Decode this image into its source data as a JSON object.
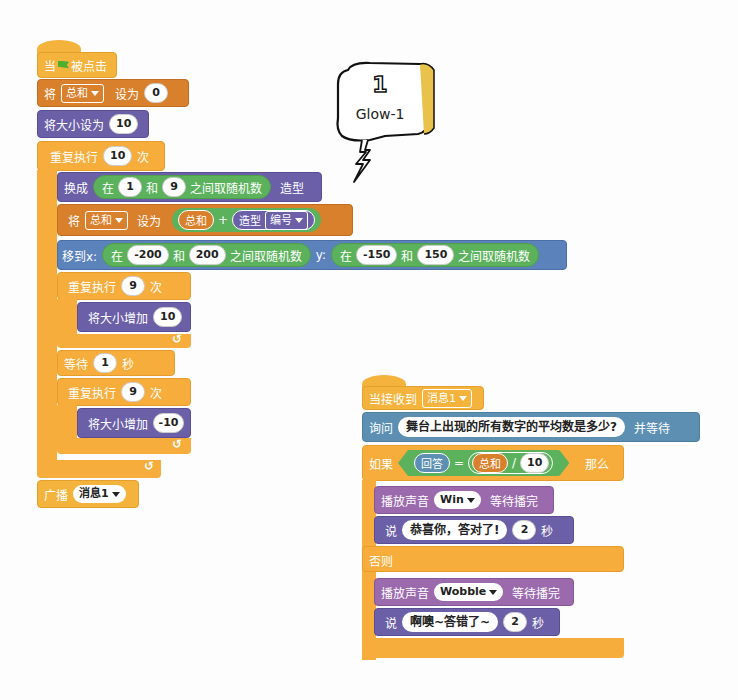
{
  "script1": {
    "hat": {
      "when": "当",
      "flag_icon": "green-flag-icon",
      "clicked": "被点击"
    },
    "set_var": {
      "label": "将",
      "var": "总和",
      "to": "设为",
      "value": "0"
    },
    "set_size": {
      "label": "将大小设为",
      "value": "10"
    },
    "repeat_outer": {
      "label": "重复执行",
      "count": "10",
      "times": "次"
    },
    "switch_costume": {
      "label": "换成",
      "rand_in": "在",
      "from": "1",
      "and": "和",
      "to": "9",
      "rand_label": "之间取随机数",
      "suffix": "造型"
    },
    "set_var2": {
      "label": "将",
      "var": "总和",
      "to": "设为",
      "reporter_var": "总和",
      "plus": "+",
      "costume_label": "造型",
      "costume_attr": "编号"
    },
    "goto_xy": {
      "label": "移到x:",
      "x_in": "在",
      "x_from": "-200",
      "x_and": "和",
      "x_to": "200",
      "x_rand": "之间取随机数",
      "y_label": "y:",
      "y_in": "在",
      "y_from": "-150",
      "y_and": "和",
      "y_to": "150",
      "y_rand": "之间取随机数"
    },
    "repeat_inner1": {
      "label": "重复执行",
      "count": "9",
      "times": "次"
    },
    "change_size1": {
      "label": "将大小增加",
      "value": "10"
    },
    "wait": {
      "label": "等待",
      "value": "1",
      "unit": "秒"
    },
    "repeat_inner2": {
      "label": "重复执行",
      "count": "9",
      "times": "次"
    },
    "change_size2": {
      "label": "将大小增加",
      "value": "-10"
    },
    "broadcast": {
      "label": "广播",
      "message": "消息1"
    }
  },
  "sprite_bubble": {
    "number": "1",
    "name": "Glow-1"
  },
  "script2": {
    "hat": {
      "label": "当接收到",
      "message": "消息1"
    },
    "ask": {
      "label": "询问",
      "question": "舞台上出现的所有数字的平均数是多少?",
      "suffix": "并等待"
    },
    "if": {
      "label": "如果",
      "answer": "回答",
      "eq": "=",
      "var": "总和",
      "div": "/",
      "divisor": "10",
      "then": "那么"
    },
    "play_win": {
      "label": "播放声音",
      "sound": "Win",
      "suffix": "等待播完"
    },
    "say_win": {
      "label": "说",
      "text": "恭喜你，答对了!",
      "secs": "2",
      "unit": "秒"
    },
    "else": {
      "label": "否则"
    },
    "play_wobble": {
      "label": "播放声音",
      "sound": "Wobble",
      "suffix": "等待播完"
    },
    "say_wobble": {
      "label": "说",
      "text": "啊噢~答错了~",
      "secs": "2",
      "unit": "秒"
    }
  },
  "colors": {
    "events": "#f4b33c",
    "control": "#f6ad3b",
    "data": "#d9802c",
    "looks": "#6b5fa8",
    "motion": "#5b82bb",
    "sensing": "#5d8fb3",
    "sound": "#9a6aad",
    "operators": "#5cb25c"
  }
}
